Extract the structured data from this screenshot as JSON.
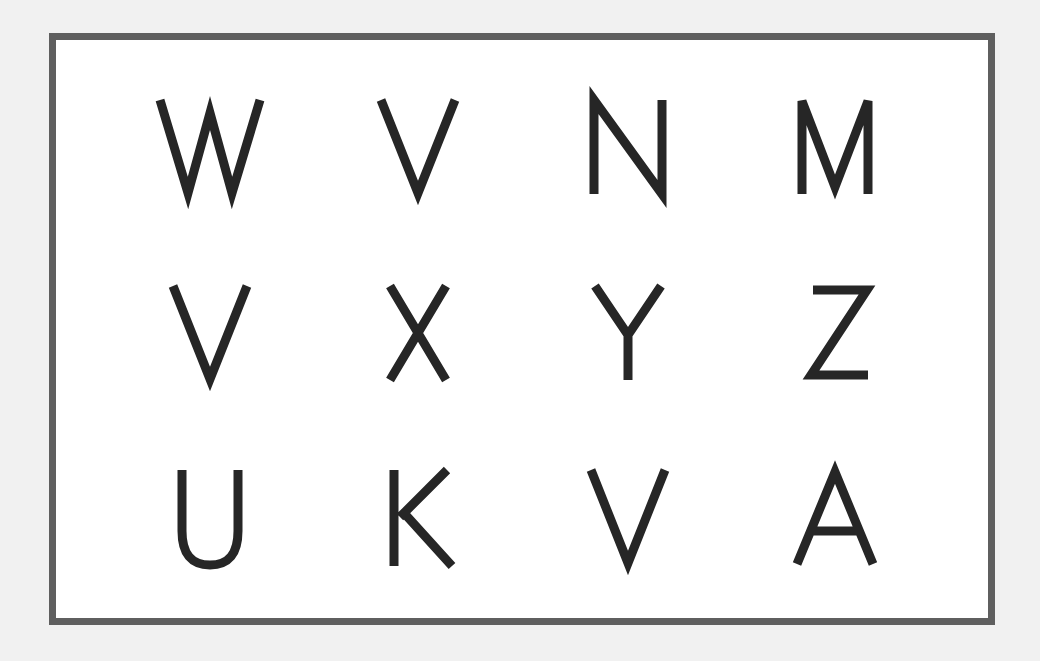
{
  "chart": {
    "grid": {
      "rows": 3,
      "columns": 4,
      "letters": [
        [
          "W",
          "V",
          "N",
          "M"
        ],
        [
          "V",
          "X",
          "Y",
          "Z"
        ],
        [
          "U",
          "K",
          "V",
          "A"
        ]
      ]
    },
    "colors": {
      "background": "#f1f1f1",
      "border": "#5f5f5f",
      "panel": "#ffffff",
      "letter": "#262626"
    }
  }
}
